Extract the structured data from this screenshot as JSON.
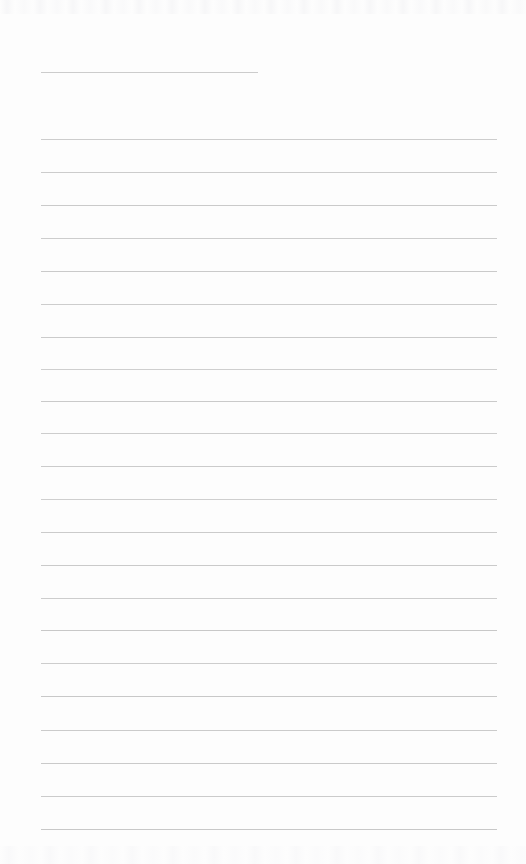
{
  "page": {
    "kind": "ruled-notepad-page",
    "width": 526,
    "height": 864,
    "background_color": "#fdfdfd",
    "has_visible_text": false,
    "text_content": "",
    "rule_color": "#c9c9c9",
    "rule_thickness_px": 1,
    "left_margin_px": 41,
    "right_edge_px": 497,
    "line_spacing_px": 32.7,
    "title_rule_count": 1,
    "body_rule_count": 22,
    "total_rule_count": 23
  },
  "rules": [
    {
      "name": "title-rule",
      "x": 41,
      "y": 72,
      "width": 217,
      "color": "#c9c9c9",
      "opacity": 0.95
    },
    {
      "name": "body-rule-1",
      "x": 41,
      "y": 139,
      "width": 456,
      "color": "#c9c9c9",
      "opacity": 0.92
    },
    {
      "name": "body-rule-2",
      "x": 41,
      "y": 172,
      "width": 456,
      "color": "#c9c9c9",
      "opacity": 0.95
    },
    {
      "name": "body-rule-3",
      "x": 41,
      "y": 205,
      "width": 456,
      "color": "#c7c7c7",
      "opacity": 0.95
    },
    {
      "name": "body-rule-4",
      "x": 41,
      "y": 238,
      "width": 456,
      "color": "#c9c9c9",
      "opacity": 0.92
    },
    {
      "name": "body-rule-5",
      "x": 41,
      "y": 271,
      "width": 456,
      "color": "#c7c7c7",
      "opacity": 0.95
    },
    {
      "name": "body-rule-6",
      "x": 41,
      "y": 304,
      "width": 456,
      "color": "#c9c9c9",
      "opacity": 0.93
    },
    {
      "name": "body-rule-7",
      "x": 41,
      "y": 337,
      "width": 456,
      "color": "#c8c8c8",
      "opacity": 0.95
    },
    {
      "name": "body-rule-8",
      "x": 41,
      "y": 369,
      "width": 456,
      "color": "#cacaca",
      "opacity": 0.9
    },
    {
      "name": "body-rule-9",
      "x": 41,
      "y": 401,
      "width": 456,
      "color": "#c7c7c7",
      "opacity": 0.95
    },
    {
      "name": "body-rule-10",
      "x": 41,
      "y": 433,
      "width": 456,
      "color": "#c9c9c9",
      "opacity": 0.93
    },
    {
      "name": "body-rule-11",
      "x": 41,
      "y": 466,
      "width": 456,
      "color": "#c8c8c8",
      "opacity": 0.95
    },
    {
      "name": "body-rule-12",
      "x": 41,
      "y": 499,
      "width": 456,
      "color": "#cacaca",
      "opacity": 0.9
    },
    {
      "name": "body-rule-13",
      "x": 41,
      "y": 532,
      "width": 456,
      "color": "#c8c8c8",
      "opacity": 0.95
    },
    {
      "name": "body-rule-14",
      "x": 41,
      "y": 565,
      "width": 456,
      "color": "#c7c7c7",
      "opacity": 0.95
    },
    {
      "name": "body-rule-15",
      "x": 41,
      "y": 598,
      "width": 456,
      "color": "#c9c9c9",
      "opacity": 0.93
    },
    {
      "name": "body-rule-16",
      "x": 41,
      "y": 630,
      "width": 456,
      "color": "#c6c6c6",
      "opacity": 0.96
    },
    {
      "name": "body-rule-17",
      "x": 41,
      "y": 663,
      "width": 456,
      "color": "#c9c9c9",
      "opacity": 0.92
    },
    {
      "name": "body-rule-18",
      "x": 41,
      "y": 696,
      "width": 456,
      "color": "#c6c6c6",
      "opacity": 0.96
    },
    {
      "name": "body-rule-19",
      "x": 41,
      "y": 730,
      "width": 456,
      "color": "#c8c8c8",
      "opacity": 0.94
    },
    {
      "name": "body-rule-20",
      "x": 41,
      "y": 763,
      "width": 456,
      "color": "#c7c7c7",
      "opacity": 0.95
    },
    {
      "name": "body-rule-21",
      "x": 41,
      "y": 796,
      "width": 456,
      "color": "#c8c8c8",
      "opacity": 0.94
    },
    {
      "name": "body-rule-22",
      "x": 41,
      "y": 829,
      "width": 456,
      "color": "#c6c6c6",
      "opacity": 0.96
    }
  ]
}
